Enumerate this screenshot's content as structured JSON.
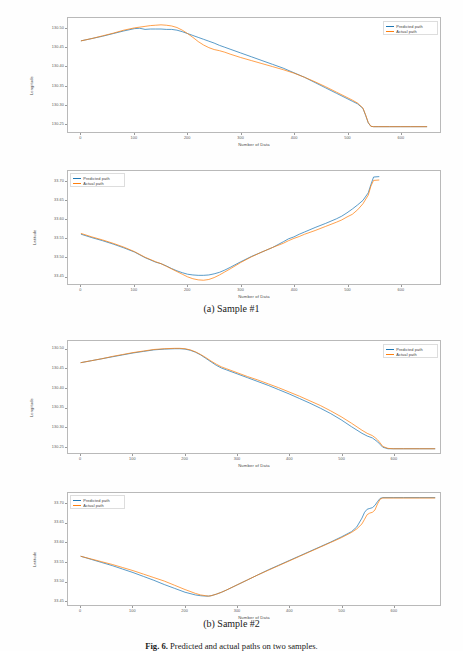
{
  "figure": {
    "caption_label": "Fig. 6.",
    "caption_text": "Predicted and actual paths on two samples.",
    "subcaptions": [
      "(a) Sample #1",
      "(b) Sample #2"
    ]
  },
  "legend": {
    "predicted_label": "Predicted path",
    "actual_label": "Actual path",
    "predicted_color": "#1f77b4",
    "actual_color": "#ff7f0e"
  },
  "axis": {
    "xlabel": "Number of Data",
    "ylabel_longitude": "Longitude",
    "ylabel_latitude": "Latitude",
    "xticks": [
      "0",
      "100",
      "200",
      "300",
      "400",
      "500",
      "600"
    ],
    "yticks_longitude": [
      "130.50",
      "130.45",
      "130.40",
      "130.35",
      "130.30",
      "130.25"
    ],
    "yticks_latitude": [
      "33.70",
      "33.65",
      "33.60",
      "33.55",
      "33.50",
      "33.45"
    ]
  },
  "chart_data": [
    {
      "id": "sample1-longitude",
      "type": "line",
      "title": "",
      "xlabel": "Number of Data",
      "ylabel": "Longitude",
      "xlim": [
        -25,
        675
      ],
      "ylim": [
        130.228,
        130.528
      ],
      "xticks": [
        0,
        100,
        200,
        300,
        400,
        500,
        600
      ],
      "yticks": [
        130.5,
        130.45,
        130.4,
        130.35,
        130.3,
        130.25
      ],
      "grid": false,
      "legend_position": "upper right",
      "series": [
        {
          "name": "Predicted path",
          "color": "#1f77b4",
          "x": [
            0,
            20,
            40,
            60,
            80,
            100,
            110,
            120,
            130,
            140,
            150,
            160,
            170,
            180,
            190,
            200,
            210,
            220,
            230,
            240,
            250,
            260,
            270,
            280,
            300,
            320,
            340,
            360,
            380,
            400,
            420,
            440,
            460,
            480,
            500,
            510,
            520,
            530,
            535,
            540,
            545,
            550,
            560,
            580,
            600,
            620,
            650
          ],
          "y": [
            130.468,
            130.474,
            130.48,
            130.487,
            130.494,
            130.5,
            130.501,
            130.498,
            130.499,
            130.499,
            130.499,
            130.498,
            130.498,
            130.496,
            130.492,
            130.487,
            130.482,
            130.477,
            130.472,
            130.467,
            130.462,
            130.456,
            130.451,
            130.446,
            130.436,
            130.426,
            130.416,
            130.406,
            130.396,
            130.384,
            130.372,
            130.358,
            130.344,
            130.33,
            130.316,
            130.309,
            130.302,
            130.29,
            130.272,
            130.252,
            130.243,
            130.242,
            130.242,
            130.242,
            130.242,
            130.242,
            130.242
          ]
        },
        {
          "name": "Actual path",
          "color": "#ff7f0e",
          "x": [
            0,
            20,
            40,
            60,
            80,
            100,
            110,
            120,
            130,
            140,
            150,
            160,
            170,
            180,
            190,
            200,
            210,
            220,
            230,
            240,
            250,
            260,
            270,
            280,
            300,
            320,
            340,
            360,
            380,
            400,
            420,
            440,
            460,
            480,
            500,
            510,
            520,
            530,
            535,
            540,
            545,
            550,
            560,
            580,
            600,
            620,
            650
          ],
          "y": [
            130.468,
            130.474,
            130.481,
            130.488,
            130.496,
            130.502,
            130.504,
            130.506,
            130.508,
            130.509,
            130.51,
            130.509,
            130.507,
            130.503,
            130.496,
            130.487,
            130.477,
            130.466,
            130.457,
            130.45,
            130.445,
            130.442,
            130.438,
            130.433,
            130.424,
            130.416,
            130.408,
            130.4,
            130.392,
            130.383,
            130.372,
            130.36,
            130.347,
            130.333,
            130.319,
            130.312,
            130.304,
            130.291,
            130.273,
            130.253,
            130.243,
            130.242,
            130.242,
            130.242,
            130.242,
            130.242,
            130.242
          ]
        }
      ]
    },
    {
      "id": "sample1-latitude",
      "type": "line",
      "title": "",
      "xlabel": "Number of Data",
      "ylabel": "Latitude",
      "xlim": [
        -25,
        675
      ],
      "ylim": [
        33.428,
        33.728
      ],
      "xticks": [
        0,
        100,
        200,
        300,
        400,
        500,
        600
      ],
      "yticks": [
        33.7,
        33.65,
        33.6,
        33.55,
        33.5,
        33.45
      ],
      "grid": false,
      "legend_position": "upper left",
      "series": [
        {
          "name": "Predicted path",
          "color": "#1f77b4",
          "x": [
            0,
            20,
            40,
            60,
            80,
            100,
            120,
            140,
            150,
            160,
            170,
            180,
            190,
            200,
            210,
            220,
            230,
            240,
            250,
            260,
            270,
            280,
            300,
            320,
            340,
            360,
            380,
            390,
            400,
            410,
            420,
            440,
            460,
            480,
            490,
            500,
            510,
            520,
            530,
            540,
            545,
            550,
            560,
            580,
            600,
            620,
            650
          ],
          "y": [
            33.56,
            33.551,
            33.543,
            33.534,
            33.524,
            33.513,
            33.498,
            33.486,
            33.482,
            33.476,
            33.469,
            33.463,
            33.458,
            33.454,
            33.452,
            33.451,
            33.451,
            33.452,
            33.455,
            33.459,
            33.465,
            33.472,
            33.487,
            33.501,
            33.513,
            33.525,
            33.54,
            33.548,
            33.553,
            33.56,
            33.566,
            33.578,
            33.589,
            33.601,
            33.608,
            33.617,
            33.627,
            33.638,
            33.65,
            33.67,
            33.692,
            33.712,
            33.713
          ]
        },
        {
          "name": "Actual path",
          "color": "#ff7f0e",
          "x": [
            0,
            20,
            40,
            60,
            80,
            100,
            120,
            140,
            150,
            160,
            170,
            180,
            190,
            200,
            210,
            220,
            230,
            240,
            250,
            260,
            270,
            280,
            300,
            320,
            340,
            360,
            380,
            390,
            400,
            410,
            420,
            440,
            460,
            480,
            490,
            500,
            510,
            520,
            530,
            540,
            545,
            550,
            560,
            580,
            600,
            620,
            650
          ],
          "y": [
            33.562,
            33.553,
            33.545,
            33.536,
            33.526,
            33.514,
            33.499,
            33.487,
            33.482,
            33.475,
            33.468,
            33.461,
            33.454,
            33.447,
            33.442,
            33.439,
            33.438,
            33.44,
            33.445,
            33.452,
            33.46,
            33.468,
            33.485,
            33.5,
            33.513,
            33.525,
            33.536,
            33.543,
            33.549,
            33.554,
            33.56,
            33.57,
            33.581,
            33.592,
            33.598,
            33.606,
            33.613,
            33.625,
            33.641,
            33.664,
            33.688,
            33.703,
            33.704
          ]
        }
      ]
    },
    {
      "id": "sample2-longitude",
      "type": "line",
      "title": "",
      "xlabel": "Number of Data",
      "ylabel": "Longitude",
      "xlim": [
        -25,
        690
      ],
      "ylim": [
        130.232,
        130.522
      ],
      "xticks": [
        0,
        100,
        200,
        300,
        400,
        500,
        600
      ],
      "yticks": [
        130.5,
        130.45,
        130.4,
        130.35,
        130.3,
        130.25
      ],
      "grid": false,
      "legend_position": "upper right",
      "series": [
        {
          "name": "Predicted path",
          "color": "#1f77b4",
          "x": [
            0,
            20,
            40,
            60,
            80,
            100,
            120,
            140,
            160,
            180,
            190,
            200,
            210,
            220,
            230,
            240,
            250,
            260,
            270,
            280,
            300,
            320,
            340,
            360,
            380,
            400,
            420,
            440,
            460,
            480,
            500,
            520,
            540,
            550,
            560,
            565,
            570,
            575,
            580,
            590,
            600,
            620,
            650,
            680
          ],
          "y": [
            130.466,
            130.471,
            130.476,
            130.481,
            130.486,
            130.491,
            130.495,
            130.499,
            130.501,
            130.502,
            130.502,
            130.501,
            130.498,
            130.493,
            130.486,
            130.477,
            130.468,
            130.459,
            130.452,
            130.447,
            130.437,
            130.427,
            130.417,
            130.407,
            130.396,
            130.385,
            130.373,
            130.361,
            130.348,
            130.334,
            130.318,
            130.3,
            130.283,
            130.276,
            130.271,
            130.266,
            130.261,
            130.254,
            130.247,
            130.243,
            130.243,
            130.243,
            130.243,
            130.243
          ]
        },
        {
          "name": "Actual path",
          "color": "#ff7f0e",
          "x": [
            0,
            20,
            40,
            60,
            80,
            100,
            120,
            140,
            160,
            180,
            190,
            200,
            210,
            220,
            230,
            240,
            250,
            260,
            270,
            280,
            300,
            320,
            340,
            360,
            380,
            400,
            420,
            440,
            460,
            480,
            500,
            520,
            540,
            550,
            560,
            565,
            570,
            575,
            580,
            590,
            600,
            620,
            650,
            680
          ],
          "y": [
            130.466,
            130.471,
            130.476,
            130.482,
            130.487,
            130.492,
            130.496,
            130.5,
            130.502,
            130.503,
            130.503,
            130.502,
            130.499,
            130.494,
            130.487,
            130.479,
            130.47,
            130.462,
            130.455,
            130.45,
            130.44,
            130.43,
            130.421,
            130.411,
            130.401,
            130.39,
            130.379,
            130.367,
            130.355,
            130.341,
            130.326,
            130.309,
            130.291,
            130.283,
            130.277,
            130.272,
            130.266,
            130.258,
            130.249,
            130.244,
            130.243,
            130.243,
            130.243,
            130.243
          ]
        }
      ]
    },
    {
      "id": "sample2-latitude",
      "type": "line",
      "title": "",
      "xlabel": "Number of Data",
      "ylabel": "Latitude",
      "xlim": [
        -25,
        690
      ],
      "ylim": [
        33.438,
        33.728
      ],
      "xticks": [
        0,
        100,
        200,
        300,
        400,
        500,
        600
      ],
      "yticks": [
        33.7,
        33.65,
        33.6,
        33.55,
        33.5,
        33.45
      ],
      "grid": false,
      "legend_position": "upper left",
      "series": [
        {
          "name": "Predicted path",
          "color": "#1f77b4",
          "x": [
            0,
            20,
            40,
            60,
            80,
            100,
            120,
            140,
            160,
            180,
            200,
            220,
            230,
            240,
            245,
            250,
            260,
            270,
            280,
            300,
            320,
            340,
            360,
            380,
            400,
            420,
            440,
            460,
            480,
            500,
            520,
            530,
            540,
            545,
            550,
            555,
            560,
            565,
            570,
            575,
            580,
            600,
            620,
            650,
            680
          ],
          "y": [
            33.564,
            33.556,
            33.548,
            33.54,
            33.531,
            33.522,
            33.512,
            33.502,
            33.491,
            33.481,
            33.471,
            33.464,
            33.462,
            33.461,
            33.461,
            33.462,
            33.466,
            33.471,
            33.477,
            33.49,
            33.503,
            33.516,
            33.529,
            33.541,
            33.553,
            33.565,
            33.577,
            33.589,
            33.601,
            33.614,
            33.628,
            33.64,
            33.663,
            33.678,
            33.686,
            33.688,
            33.69,
            33.696,
            33.706,
            33.714,
            33.716,
            33.716,
            33.716,
            33.716,
            33.716
          ]
        },
        {
          "name": "Actual path",
          "color": "#ff7f0e",
          "x": [
            0,
            20,
            40,
            60,
            80,
            100,
            120,
            140,
            160,
            180,
            200,
            220,
            230,
            240,
            245,
            250,
            260,
            270,
            280,
            300,
            320,
            340,
            360,
            380,
            400,
            420,
            440,
            460,
            480,
            500,
            520,
            530,
            540,
            545,
            550,
            555,
            560,
            565,
            570,
            575,
            580,
            600,
            620,
            650,
            680
          ],
          "y": [
            33.564,
            33.557,
            33.55,
            33.543,
            33.535,
            33.527,
            33.518,
            33.509,
            33.5,
            33.489,
            33.478,
            33.468,
            33.464,
            33.462,
            33.461,
            33.462,
            33.466,
            33.471,
            33.477,
            33.49,
            33.503,
            33.516,
            33.528,
            33.54,
            33.552,
            33.564,
            33.576,
            33.588,
            33.6,
            33.612,
            33.626,
            33.635,
            33.648,
            33.66,
            33.672,
            33.676,
            33.678,
            33.684,
            33.7,
            33.712,
            33.715,
            33.715,
            33.715,
            33.715,
            33.715
          ]
        }
      ]
    }
  ]
}
